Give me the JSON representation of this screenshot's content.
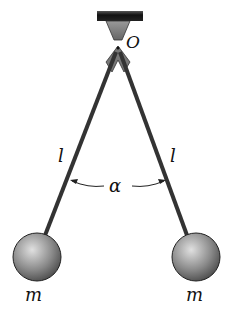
{
  "labels": {
    "pivot": "O",
    "length_left": "l",
    "length_right": "l",
    "angle": "α",
    "mass_left": "m",
    "mass_right": "m"
  },
  "colors": {
    "rod": "#333333",
    "ceiling": "#1a1a1a",
    "ball_light": "#d8d8d8",
    "ball_dark": "#555555"
  }
}
